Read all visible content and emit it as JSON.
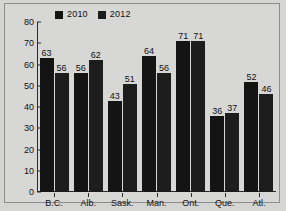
{
  "chart_data": {
    "type": "bar",
    "title": "",
    "xlabel": "",
    "ylabel": "",
    "ylim": [
      0,
      80
    ],
    "yticks": [
      0,
      10,
      20,
      30,
      40,
      50,
      60,
      70,
      80
    ],
    "grid": false,
    "legend_position": "top",
    "categories": [
      "B.C.",
      "Alb.",
      "Sask.",
      "Man.",
      "Ont.",
      "Que.",
      "Atl."
    ],
    "series": [
      {
        "name": "2010",
        "color": "#141414",
        "values": [
          63,
          56,
          43,
          64,
          71,
          36,
          52
        ]
      },
      {
        "name": "2012",
        "color": "#1d1d1d",
        "values": [
          56,
          62,
          51,
          56,
          71,
          37,
          46
        ]
      }
    ]
  },
  "colors": {
    "background": "#d5d5d3",
    "frame": "#8d8d8b",
    "axis": "#2a2a2a",
    "text": "#111111"
  }
}
